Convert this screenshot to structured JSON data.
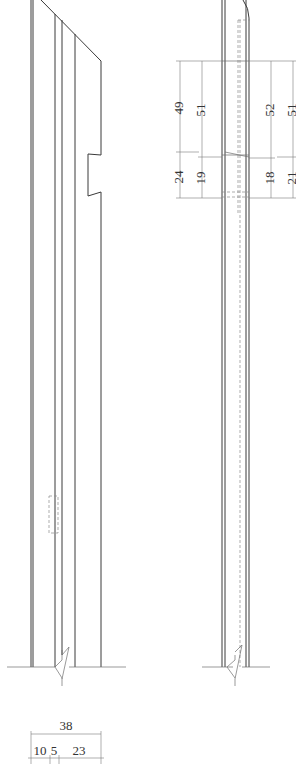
{
  "drawing": {
    "type": "elevation-detail",
    "views": [
      {
        "name": "left-elevation",
        "description": "Member with diagonal top cut and notch"
      },
      {
        "name": "right-elevation",
        "description": "Member side view with rounded top and dashed hidden lines"
      }
    ],
    "colors": {
      "line": "#3a3a3a",
      "dim": "#7a7a7a",
      "text": "#333333",
      "background": "#ffffff"
    }
  },
  "dimensions": {
    "right_view_left_outer": [
      "49",
      "24"
    ],
    "right_view_left_inner": [
      "51",
      "19"
    ],
    "right_view_right_inner": [
      "52",
      "18"
    ],
    "right_view_right_outer": [
      "51",
      "21"
    ],
    "bottom_total": "38",
    "bottom_parts": [
      "10",
      "5",
      "23"
    ]
  }
}
